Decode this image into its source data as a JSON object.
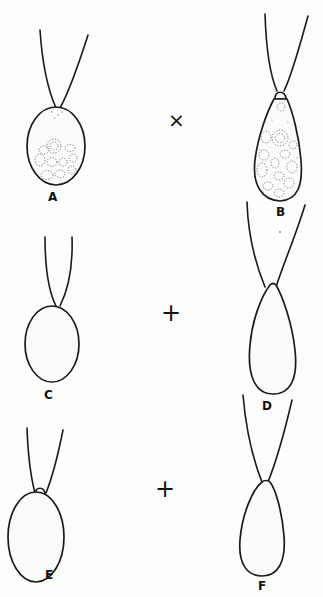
{
  "figure": {
    "panels": [
      {
        "id": "A",
        "label": "A",
        "shape": "oval",
        "contents": "granular with vacuoles"
      },
      {
        "id": "B",
        "label": "B",
        "shape": "pyriform with apical papilla",
        "contents": "granular with vacuoles"
      },
      {
        "id": "C",
        "label": "C",
        "shape": "oval",
        "contents": "empty"
      },
      {
        "id": "D",
        "label": "D",
        "shape": "pyriform",
        "contents": "empty"
      },
      {
        "id": "E",
        "label": "E",
        "shape": "oval with apical papilla",
        "contents": "empty"
      },
      {
        "id": "F",
        "label": "F",
        "shape": "pyriform",
        "contents": "empty"
      }
    ],
    "operators": [
      {
        "between": [
          "A",
          "B"
        ],
        "symbol": "×"
      },
      {
        "between": [
          "C",
          "D"
        ],
        "symbol": "+"
      },
      {
        "between": [
          "E",
          "F"
        ],
        "symbol": "+"
      }
    ]
  }
}
